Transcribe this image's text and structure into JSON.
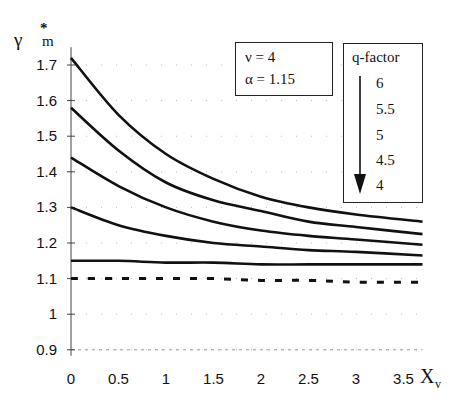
{
  "chart_data": {
    "type": "line",
    "title": "",
    "ylabel": "γ*m",
    "xlabel": "Xv",
    "xlim": [
      0,
      3.7
    ],
    "ylim": [
      0.9,
      1.75
    ],
    "x_ticks": [
      "0",
      "0.5",
      "1",
      "1.5",
      "2",
      "2.5",
      "3",
      "3.5"
    ],
    "y_ticks": [
      "0.9",
      "1",
      "1.1",
      "1.2",
      "1.3",
      "1.4",
      "1.5",
      "1.6",
      "1.7"
    ],
    "grid": "dotted (faint)",
    "x": [
      0,
      0.5,
      1,
      1.5,
      2,
      2.5,
      3,
      3.7
    ],
    "series": [
      {
        "name": "q = 6",
        "style": "solid",
        "values": [
          1.72,
          1.56,
          1.45,
          1.38,
          1.33,
          1.3,
          1.28,
          1.26
        ]
      },
      {
        "name": "q = 5.5",
        "style": "solid",
        "values": [
          1.58,
          1.46,
          1.37,
          1.32,
          1.29,
          1.26,
          1.245,
          1.225
        ]
      },
      {
        "name": "q = 5",
        "style": "solid",
        "values": [
          1.44,
          1.36,
          1.3,
          1.26,
          1.235,
          1.22,
          1.21,
          1.195
        ]
      },
      {
        "name": "q = 4.5",
        "style": "solid",
        "values": [
          1.3,
          1.25,
          1.22,
          1.2,
          1.19,
          1.18,
          1.175,
          1.165
        ]
      },
      {
        "name": "q = 4",
        "style": "solid",
        "values": [
          1.15,
          1.15,
          1.145,
          1.145,
          1.14,
          1.14,
          1.14,
          1.14
        ]
      },
      {
        "name": "α = 1.15 reference",
        "style": "dashed",
        "values": [
          1.1,
          1.1,
          1.1,
          1.1,
          1.095,
          1.095,
          1.09,
          1.09
        ]
      }
    ],
    "annotations": {
      "params": [
        "ν = 4",
        "α = 1.15"
      ],
      "legend_title": "q-factor",
      "legend_entries": [
        "6",
        "5.5",
        "5",
        "4.5",
        "4"
      ],
      "legend_arrow": "down (decreasing q)"
    }
  },
  "axes": {
    "y_label_main": "γ",
    "y_label_sup": "*",
    "y_label_sub": "m",
    "x_label_main": "X",
    "x_label_sub": "v"
  },
  "params_box": {
    "line1": "ν = 4",
    "line2": "α = 1.15"
  },
  "qfactor_box": {
    "title": "q-factor",
    "items": [
      "6",
      "5.5",
      "5",
      "4.5",
      "4"
    ]
  }
}
